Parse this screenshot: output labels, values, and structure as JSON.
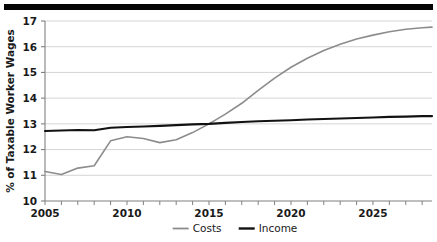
{
  "figure": {
    "top_rule_color": "#050505",
    "background": "#ffffff"
  },
  "chart_data": {
    "type": "line",
    "title": "",
    "subtitle": "",
    "xlabel": "",
    "ylabel": "% of Taxable Worker Wages",
    "xlim": [
      2005,
      2028.6
    ],
    "ylim": [
      10,
      17
    ],
    "yticks": [
      10,
      11,
      12,
      13,
      14,
      15,
      16,
      17
    ],
    "ytick_labels": [
      "10",
      "11",
      "12",
      "13",
      "14",
      "15",
      "16",
      "17"
    ],
    "xticks": [
      2005,
      2006,
      2007,
      2008,
      2009,
      2010,
      2011,
      2012,
      2013,
      2014,
      2015,
      2016,
      2017,
      2018,
      2019,
      2020,
      2021,
      2022,
      2023,
      2024,
      2025,
      2026,
      2027,
      2028
    ],
    "xtick_labels_shown": [
      "2005",
      "2010",
      "2015",
      "2020",
      "2025"
    ],
    "xtick_labels_values": [
      2005,
      2010,
      2015,
      2020,
      2025
    ],
    "grid": "horizontal",
    "grid_color": "#c9c9c9",
    "axis_color": "#808080",
    "legend_position": "bottom-center",
    "x": [
      2005,
      2006,
      2007,
      2008,
      2009,
      2010,
      2011,
      2012,
      2013,
      2014,
      2015,
      2016,
      2017,
      2018,
      2019,
      2020,
      2021,
      2022,
      2023,
      2024,
      2025,
      2026,
      2027,
      2028,
      2028.6
    ],
    "series": [
      {
        "name": "Costs",
        "color": "#8c8c8c",
        "width": 1.6,
        "values": [
          11.15,
          11.03,
          11.28,
          11.37,
          12.34,
          12.5,
          12.43,
          12.27,
          12.38,
          12.66,
          13.0,
          13.38,
          13.8,
          14.3,
          14.78,
          15.2,
          15.55,
          15.85,
          16.1,
          16.3,
          16.45,
          16.58,
          16.68,
          16.74,
          16.76
        ]
      },
      {
        "name": "Income",
        "color": "#121212",
        "width": 2.1,
        "values": [
          12.72,
          12.74,
          12.76,
          12.75,
          12.85,
          12.88,
          12.9,
          12.92,
          12.95,
          12.98,
          13.0,
          13.04,
          13.07,
          13.1,
          13.12,
          13.14,
          13.17,
          13.19,
          13.21,
          13.23,
          13.25,
          13.27,
          13.28,
          13.3,
          13.3
        ]
      }
    ],
    "legend": [
      {
        "label": "Costs",
        "color": "#8c8c8c",
        "width": 1.8
      },
      {
        "label": "Income",
        "color": "#121212",
        "width": 2.4
      }
    ]
  },
  "layout": {
    "plot_left": 45,
    "plot_right": 432,
    "plot_top": 21,
    "plot_bottom": 201
  }
}
